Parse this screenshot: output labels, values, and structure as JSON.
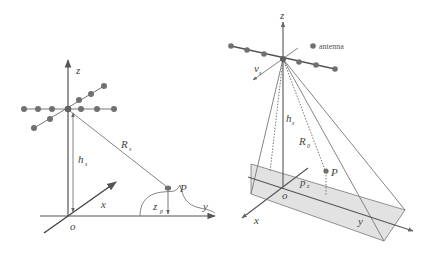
{
  "colors": {
    "line": "#555555",
    "light_line": "#888888",
    "antenna": "#707070",
    "plane_fill": "#e0e0e0",
    "plane_stroke": "#666666",
    "background": "#ffffff"
  },
  "left_diagram": {
    "axis_z_label": "z",
    "axis_x_label": "x",
    "axis_y_label": "y",
    "origin_label": "o",
    "height_label": "h",
    "height_sub": "s",
    "range_label": "R",
    "range_sub": "s",
    "point_label": "P",
    "point_height_label": "z",
    "point_height_sub": "p"
  },
  "right_diagram": {
    "axis_z_label": "z",
    "axis_x_label": "x",
    "axis_y_label": "y",
    "origin_label": "o",
    "velocity_label": "v",
    "velocity_sub": "s",
    "height_label": "h",
    "height_sub": "s",
    "range_label": "R",
    "range_sub": "0",
    "point_label": "P",
    "pz_label": "p",
    "pz_sub": "z",
    "legend_label": "antenna"
  }
}
